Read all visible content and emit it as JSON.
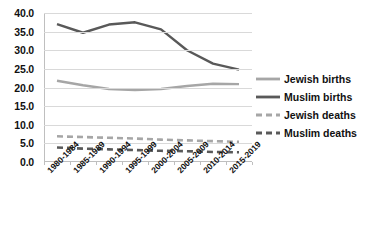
{
  "chart_data": {
    "type": "line",
    "title": "",
    "xlabel": "",
    "ylabel": "",
    "ylim": [
      0,
      40
    ],
    "ytick_step": 5,
    "grid": true,
    "legend_position": "right",
    "categories": [
      "1980-1984",
      "1985-1989",
      "1990-1994",
      "1995-1999",
      "2000-2004",
      "2005-2009",
      "2010-2014",
      "2015-2019"
    ],
    "ytick_labels": [
      "40.0",
      "35.0",
      "30.0",
      "25.0",
      "20.0",
      "15.0",
      "10.0",
      "5.0",
      "0.0"
    ],
    "ytick_values": [
      40,
      35,
      30,
      25,
      20,
      15,
      10,
      5,
      0
    ],
    "series": [
      {
        "name": "Jewish births",
        "color": "#A6A6A6",
        "style": "solid",
        "values": [
          21.8,
          20.6,
          19.6,
          19.3,
          19.6,
          20.4,
          21.0,
          20.9
        ]
      },
      {
        "name": "Muslim births",
        "color": "#595959",
        "style": "solid",
        "values": [
          37.0,
          34.7,
          36.9,
          37.5,
          35.6,
          30.0,
          26.4,
          24.8
        ]
      },
      {
        "name": "Jewish deaths",
        "color": "#A6A6A6",
        "style": "dashed",
        "values": [
          6.9,
          6.7,
          6.5,
          6.3,
          6.0,
          5.8,
          5.6,
          5.4
        ]
      },
      {
        "name": "Muslim deaths",
        "color": "#595959",
        "style": "dashed",
        "values": [
          3.9,
          3.6,
          3.4,
          3.2,
          3.0,
          2.9,
          2.7,
          2.6
        ]
      }
    ]
  }
}
